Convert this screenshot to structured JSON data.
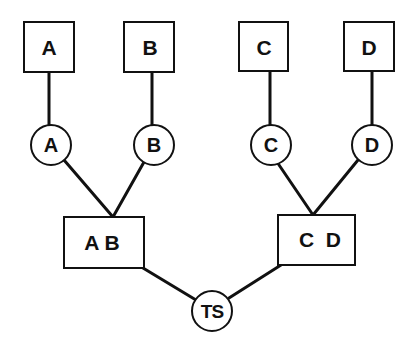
{
  "diagram": {
    "type": "merge-tree",
    "colors": {
      "stroke": "#111111",
      "fill": "#ffffff",
      "background": "#ffffff"
    },
    "top_boxes": [
      {
        "id": "A",
        "label": "A"
      },
      {
        "id": "B",
        "label": "B"
      },
      {
        "id": "C",
        "label": "C"
      },
      {
        "id": "D",
        "label": "D"
      }
    ],
    "circles": [
      {
        "id": "cA",
        "label": "A"
      },
      {
        "id": "cB",
        "label": "B"
      },
      {
        "id": "cC",
        "label": "C"
      },
      {
        "id": "cD",
        "label": "D"
      }
    ],
    "merge_boxes": [
      {
        "id": "AB",
        "label": "A B"
      },
      {
        "id": "CD",
        "label": "C  D"
      }
    ],
    "root": {
      "id": "TS",
      "label": "TS"
    },
    "edges": [
      [
        "A",
        "cA"
      ],
      [
        "B",
        "cB"
      ],
      [
        "C",
        "cC"
      ],
      [
        "D",
        "cD"
      ],
      [
        "cA",
        "AB"
      ],
      [
        "cB",
        "AB"
      ],
      [
        "cC",
        "CD"
      ],
      [
        "cD",
        "CD"
      ],
      [
        "AB",
        "TS"
      ],
      [
        "CD",
        "TS"
      ]
    ]
  }
}
